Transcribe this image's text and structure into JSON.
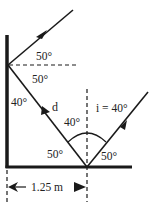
{
  "diagram": {
    "type": "reflection-two-mirrors",
    "colors": {
      "line": "#1a1a1a",
      "text": "#222222",
      "background": "#ffffff"
    },
    "labels": {
      "upper_reflected_angle": "50°",
      "wall_normal_lower_angle": "50°",
      "wall_mirror_angle": "40°",
      "ray_label": "d",
      "reflected_angle_from_normal": "40°",
      "incident_angle": "i = 40°",
      "floor_left_angle": "50°",
      "floor_right_angle": "50°",
      "distance": "1.25 m"
    }
  }
}
